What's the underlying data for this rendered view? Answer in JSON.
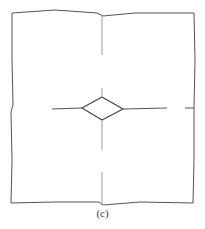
{
  "figure": {
    "label": "(c)",
    "stroke_color": "#555555",
    "faint_color": "#9a9a9a",
    "outline_points": "12,13 55,10 97,13 103,16 135,13 194,13 195,60 194,108 194,160 193,203 140,202 103,205 99,202 55,202 11,203 12,160 11,112 13,105 12,60 12,13",
    "diamond_points": "82,108 102,97 123,109 102,120",
    "lines": [
      {
        "name": "top-vertical-line",
        "x1": 102,
        "y1": 16,
        "x2": 102,
        "y2": 55,
        "faint": true
      },
      {
        "name": "top-stub-line",
        "x1": 102,
        "y1": 88,
        "x2": 102,
        "y2": 97,
        "faint": true
      },
      {
        "name": "left-horizontal-line",
        "x1": 52,
        "y1": 109,
        "x2": 82,
        "y2": 108,
        "faint": false
      },
      {
        "name": "right-horizontal-line",
        "x1": 123,
        "y1": 109,
        "x2": 167,
        "y2": 108,
        "faint": false
      },
      {
        "name": "right-edge-tick",
        "x1": 185,
        "y1": 108,
        "x2": 194,
        "y2": 108,
        "faint": false
      },
      {
        "name": "bottom-vertical-line-upper",
        "x1": 102,
        "y1": 120,
        "x2": 102,
        "y2": 150,
        "faint": true
      },
      {
        "name": "bottom-vertical-line-lower",
        "x1": 102,
        "y1": 172,
        "x2": 102,
        "y2": 204,
        "faint": true
      }
    ]
  }
}
